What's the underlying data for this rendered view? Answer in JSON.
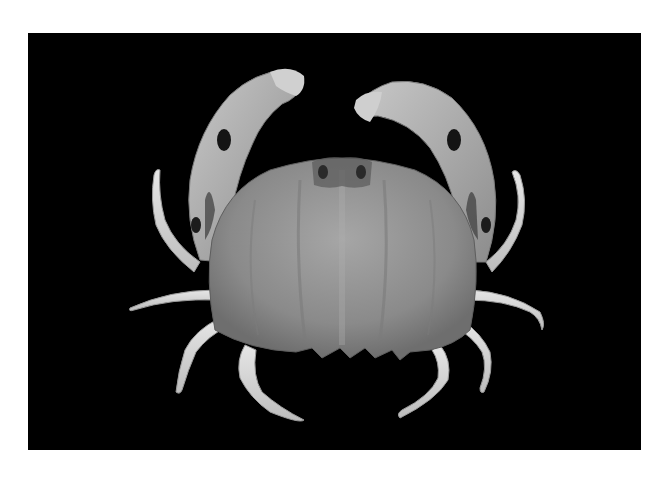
{
  "image": {
    "subject": "crab",
    "style": "grayscale photograph",
    "background_color": "#000000",
    "page_background": "#ffffff",
    "frame": {
      "x": 28,
      "y": 33,
      "width": 613,
      "height": 417
    },
    "colors": {
      "carapace": "#8e8e8e",
      "carapace_light": "#b5b5b5",
      "legs": "#d8d8d8",
      "claws": "#a8a8a8",
      "dark_spots": "#1a1a1a"
    }
  }
}
